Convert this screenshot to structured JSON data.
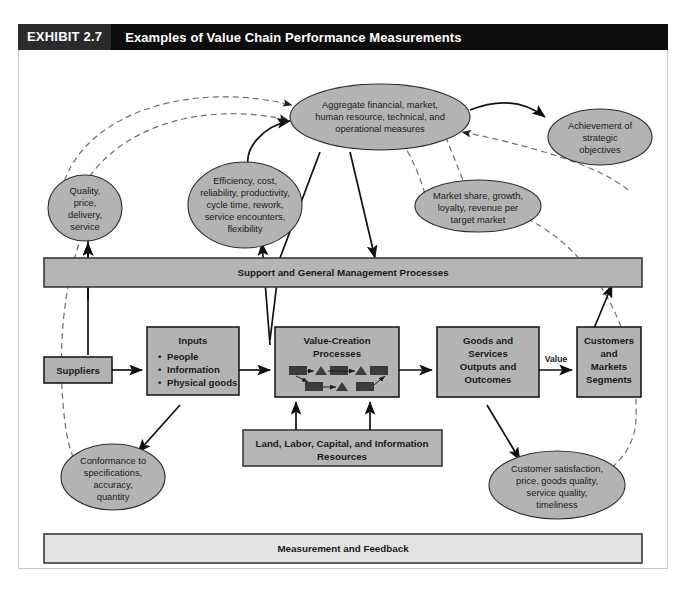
{
  "exhibit": {
    "tag": "EXHIBIT 2.7",
    "title": "Examples of Value Chain Performance Measurements"
  },
  "ellipses": {
    "aggregate": [
      "Aggregate financial, market,",
      "human resource, technical, and",
      "operational measures"
    ],
    "achievement": [
      "Achievement of",
      "strategic",
      "objectives"
    ],
    "quality": [
      "Quality,",
      "price,",
      "delivery,",
      "service"
    ],
    "efficiency": [
      "Efficiency, cost,",
      "reliability, productivity,",
      "cycle time, rework,",
      "service encounters,",
      "flexibility"
    ],
    "market_share": [
      "Market share, growth,",
      "loyalty, revenue per",
      "target market"
    ],
    "conformance": [
      "Conformance to",
      "specifications,",
      "accuracy,",
      "quantity"
    ],
    "customer_sat": [
      "Customer satisfaction,",
      "price, goods quality,",
      "service quality,",
      "timeliness"
    ]
  },
  "bars": {
    "support": "Support and General Management Processes",
    "measurement": "Measurement and Feedback"
  },
  "boxes": {
    "suppliers": {
      "title": "Suppliers"
    },
    "inputs": {
      "title": "Inputs",
      "bullets": [
        "People",
        "Information",
        "Physical goods"
      ]
    },
    "value_creation": {
      "title": [
        "Value-Creation",
        "Processes"
      ]
    },
    "goods_services": {
      "title": [
        "Goods and",
        "Services",
        "Outputs and",
        "Outcomes"
      ]
    },
    "customers": {
      "title": [
        "Customers",
        "and",
        "Markets",
        "Segments"
      ]
    },
    "resources": {
      "title": [
        "Land, Labor, Capital, and Information",
        "Resources"
      ]
    }
  },
  "edge_labels": {
    "value": "Value"
  },
  "colors": {
    "header_bg": "#0d0d0d",
    "tag_bg": "#2b2b2b",
    "shape_fill": "#b3b3b3",
    "bar_fill": "#b5b5b5",
    "bar_light_fill": "#e3e3e3",
    "stroke": "#1c1c1c",
    "dashed_stroke": "#6f6f6f"
  }
}
